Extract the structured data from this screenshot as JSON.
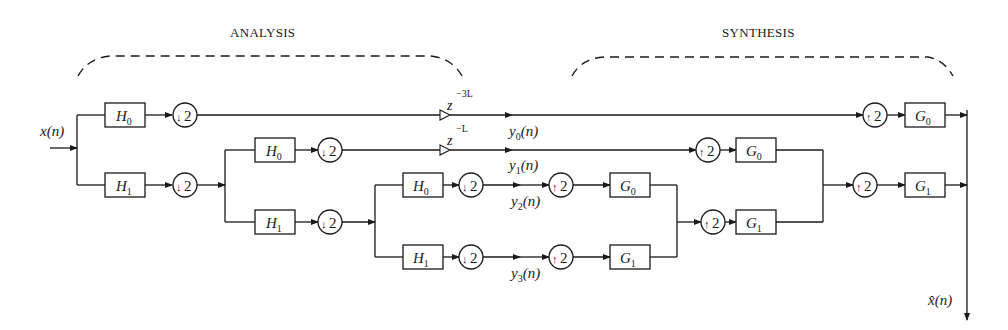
{
  "headers": {
    "analysis": "ANALYSIS",
    "synthesis": "SYNTHESIS"
  },
  "signals": {
    "input": "x(n)",
    "output": "x̂(n)",
    "y0": "y",
    "y0_sub": "0",
    "y1": "y",
    "y1_sub": "1",
    "y2": "y",
    "y2_sub": "2",
    "y3": "y",
    "y3_sub": "3",
    "arg": "(n)"
  },
  "delays": {
    "d1_base": "z",
    "d1_exp": "−3L",
    "d2_base": "z",
    "d2_exp": "−L"
  },
  "filters": {
    "analysis": [
      {
        "base": "H",
        "sub": "0",
        "stage": 1
      },
      {
        "base": "H",
        "sub": "1",
        "stage": 1
      },
      {
        "base": "H",
        "sub": "0",
        "stage": 2
      },
      {
        "base": "H",
        "sub": "1",
        "stage": 2
      },
      {
        "base": "H",
        "sub": "0",
        "stage": 3
      },
      {
        "base": "H",
        "sub": "1",
        "stage": 3
      }
    ],
    "synthesis": [
      {
        "base": "G",
        "sub": "0",
        "stage": 3
      },
      {
        "base": "G",
        "sub": "1",
        "stage": 3
      },
      {
        "base": "G",
        "sub": "0",
        "stage": 2
      },
      {
        "base": "G",
        "sub": "1",
        "stage": 2
      },
      {
        "base": "G",
        "sub": "0",
        "stage": 1
      },
      {
        "base": "G",
        "sub": "1",
        "stage": 1
      }
    ]
  },
  "samplers": {
    "down": "2",
    "up": "2",
    "down_arrow": "↓",
    "up_arrow": "↑"
  }
}
